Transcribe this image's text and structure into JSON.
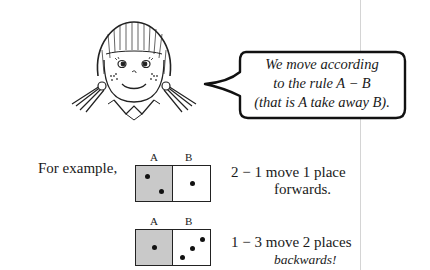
{
  "speech_bubble": {
    "lines": [
      "We move according",
      "to the rule A − B",
      "(that is A take away B)."
    ]
  },
  "intro_label": "For example,",
  "examples": [
    {
      "label_a": "A",
      "label_b": "B",
      "pips_a": 2,
      "pips_b": 1,
      "line1": "2 − 1 move 1 place",
      "line2": "forwards.",
      "line2_italic": false
    },
    {
      "label_a": "A",
      "label_b": "B",
      "pips_a": 1,
      "pips_b": 3,
      "line1": "1 − 3 move 2 places",
      "line2": "backwards!",
      "line2_italic": true
    }
  ],
  "colors": {
    "shaded_half": "#c9c9c9",
    "ink": "#1a1a1a"
  }
}
